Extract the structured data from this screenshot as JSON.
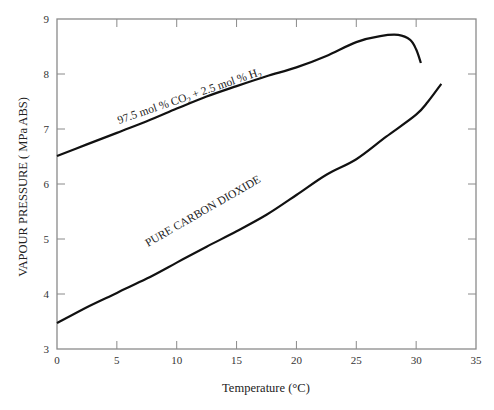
{
  "chart_data": {
    "type": "line",
    "title": "",
    "xlabel": "Temperature (°C)",
    "ylabel": "VAPOUR PRESSURE ( MPa ABS)",
    "xlim": [
      0,
      35
    ],
    "ylim": [
      3,
      9
    ],
    "xticks": [
      0,
      5,
      10,
      15,
      20,
      25,
      30,
      35
    ],
    "yticks": [
      3,
      4,
      5,
      6,
      7,
      8,
      9
    ],
    "grid": false,
    "legend": "none (inline curve labels)",
    "series": [
      {
        "name": "97.5 mol % CO2 + 2.5 mol % H2",
        "label_main": "97.5 mol % CO",
        "label_sub1": "2",
        "label_mid": " + 2.5 mol % H",
        "label_sub2": "2",
        "x": [
          0,
          2.5,
          5,
          7.5,
          10,
          12.5,
          15,
          17.5,
          20,
          22.5,
          25,
          27,
          28.5,
          29.5,
          30,
          30.4
        ],
        "y": [
          6.51,
          6.72,
          6.93,
          7.14,
          7.37,
          7.59,
          7.78,
          7.96,
          8.12,
          8.33,
          8.58,
          8.69,
          8.71,
          8.62,
          8.45,
          8.2
        ]
      },
      {
        "name": "PURE CARBON DIOXIDE",
        "label": "PURE CARBON DIOXIDE",
        "x": [
          0,
          2.5,
          5,
          7.5,
          10,
          12.5,
          15,
          17.5,
          20,
          22.5,
          25,
          27.5,
          30,
          31,
          32.1
        ],
        "y": [
          3.47,
          3.76,
          4.02,
          4.28,
          4.57,
          4.86,
          5.14,
          5.44,
          5.8,
          6.17,
          6.45,
          6.86,
          7.26,
          7.5,
          7.82
        ]
      }
    ]
  }
}
